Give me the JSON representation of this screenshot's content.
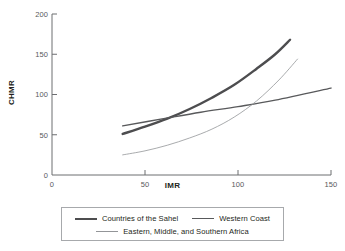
{
  "chart_data": {
    "type": "line",
    "title": "",
    "xlabel": "IMR",
    "ylabel": "CHMR",
    "xlim": [
      0,
      150
    ],
    "ylim": [
      0,
      200
    ],
    "xticks": [
      0,
      50,
      100,
      150
    ],
    "yticks": [
      0,
      50,
      100,
      150,
      200
    ],
    "xtick_labels": [
      "0",
      "50",
      "100",
      "150"
    ],
    "ytick_labels": [
      "0",
      "50",
      "100",
      "150",
      "200"
    ],
    "grid": false,
    "legend_position": "bottom",
    "series": [
      {
        "name": "Countries of the Sahel",
        "style": "thick",
        "color": "#4d4d4f",
        "linewidth": 2.4,
        "x": [
          38,
          50,
          62,
          74,
          86,
          98,
          110,
          120,
          128
        ],
        "y": [
          51,
          60,
          70,
          82,
          96,
          112,
          132,
          150,
          168
        ]
      },
      {
        "name": "Western Coast",
        "style": "medium",
        "color": "#58595b",
        "linewidth": 1.4,
        "x": [
          38,
          60,
          80,
          100,
          120,
          150
        ],
        "y": [
          61,
          70,
          78,
          85,
          93,
          108
        ]
      },
      {
        "name": "Eastern, Middle, and Southern Africa",
        "style": "thin",
        "color": "#939598",
        "linewidth": 0.8,
        "x": [
          38,
          50,
          62,
          74,
          86,
          98,
          110,
          122,
          132
        ],
        "y": [
          25,
          30,
          37,
          46,
          57,
          72,
          92,
          118,
          144
        ]
      }
    ]
  },
  "axes": {
    "y_title": "CHMR",
    "x_title": "IMR"
  },
  "legend": {
    "entries": [
      {
        "label": "Countries of the Sahel",
        "style": "thick"
      },
      {
        "label": "Western Coast",
        "style": "medium"
      },
      {
        "label": "Eastern, Middle, and Southern Africa",
        "style": "thin"
      }
    ]
  },
  "colors": {
    "axis": "#6d6e71",
    "text": "#231f20",
    "tick_text": "#58595b",
    "legend_border": "#a7a9ac",
    "background": "#ffffff"
  }
}
